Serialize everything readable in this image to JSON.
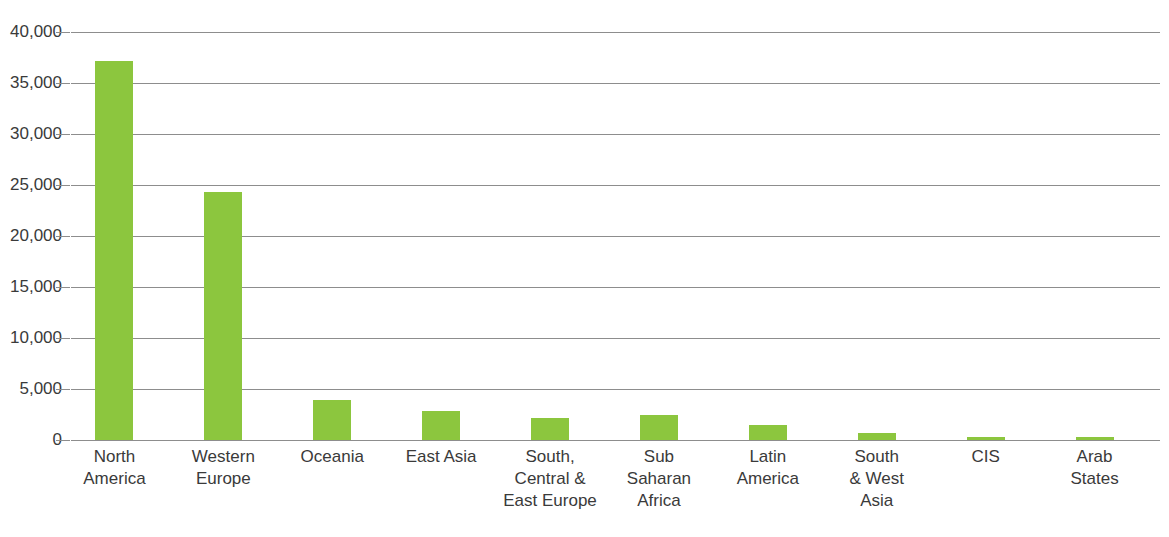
{
  "chart_data": {
    "type": "bar",
    "title": "",
    "xlabel": "",
    "ylabel": "",
    "ylim": [
      0,
      40000
    ],
    "ytick_labels": [
      "40,000",
      "35,000",
      "30,000",
      "25,000",
      "20,000",
      "15,000",
      "10,000",
      "5,000",
      "0"
    ],
    "ytick_values": [
      40000,
      35000,
      30000,
      25000,
      20000,
      15000,
      10000,
      5000,
      0
    ],
    "grid": true,
    "legend": false,
    "bar_color": "#8cc63e",
    "axis_color": "#8d8d8d",
    "text_color": "#3a3a3a",
    "categories": [
      "North America",
      "Western Europe",
      "Oceania",
      "East Asia",
      "South, Central & East Europe",
      "Sub Saharan Africa",
      "Latin America",
      "South & West Asia",
      "CIS",
      "Arab States"
    ],
    "category_label_lines": [
      [
        "North",
        "America"
      ],
      [
        "Western",
        "Europe"
      ],
      [
        "Oceania"
      ],
      [
        "East Asia"
      ],
      [
        "South,",
        "Central &",
        "East Europe"
      ],
      [
        "Sub",
        "Saharan",
        "Africa"
      ],
      [
        "Latin",
        "America"
      ],
      [
        "South",
        "& West",
        "Asia"
      ],
      [
        "CIS"
      ],
      [
        "Arab",
        "States"
      ]
    ],
    "values": [
      37200,
      24300,
      3900,
      2850,
      2150,
      2500,
      1470,
      700,
      300,
      330
    ]
  }
}
